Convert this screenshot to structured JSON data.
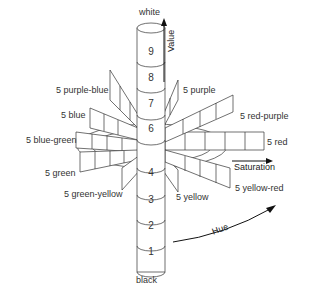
{
  "diagram": {
    "top_label": "white",
    "bottom_label": "black",
    "axes": {
      "value": "Value",
      "saturation": "Saturation",
      "hue": "Hue"
    },
    "value_levels": [
      "1",
      "2",
      "3",
      "4",
      "5",
      "6",
      "7",
      "8",
      "9"
    ],
    "visible_value_numbers": [
      "9",
      "8",
      "7",
      "6",
      "4",
      "3",
      "2",
      "1"
    ],
    "hues": [
      {
        "id": "purple-blue",
        "label": "5 purple-blue"
      },
      {
        "id": "blue",
        "label": "5 blue"
      },
      {
        "id": "blue-green",
        "label": "5 blue-green"
      },
      {
        "id": "green",
        "label": "5 green"
      },
      {
        "id": "green-yellow",
        "label": "5 green-yellow"
      },
      {
        "id": "yellow",
        "label": "5 yellow"
      },
      {
        "id": "yellow-red",
        "label": "5 yellow-red"
      },
      {
        "id": "red",
        "label": "5 red"
      },
      {
        "id": "red-purple",
        "label": "5 red-purple"
      },
      {
        "id": "purple",
        "label": "5 purple"
      }
    ],
    "colors": {
      "line": "#333333",
      "background": "#ffffff"
    }
  }
}
